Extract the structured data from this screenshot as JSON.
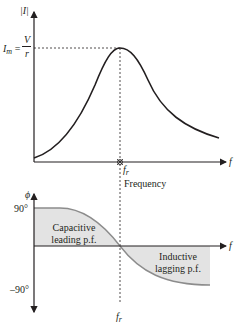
{
  "upper_plot": {
    "y_axis_label": "|I|",
    "peak_label_I": "I",
    "peak_label_sub": "m",
    "peak_label_eq": "=",
    "peak_frac_num": "V",
    "peak_frac_den": "r",
    "x_axis_label": "f",
    "resonance_label": "f",
    "resonance_sub": "r",
    "x_caption": "Frequency"
  },
  "lower_plot": {
    "y_axis_label": "ϕ",
    "tick_top": "90°",
    "tick_bottom": "–90°",
    "x_axis_label": "f",
    "resonance_label": "f",
    "resonance_sub": "r",
    "region_left_line1": "Capacitive",
    "region_left_line2": "leading p.f.",
    "region_right_line1": "Inductive",
    "region_right_line2": "lagging p.f."
  },
  "colors": {
    "curve": "#231f20",
    "shade": "#e3e3e3",
    "phase_curve": "#8c8c8c"
  }
}
